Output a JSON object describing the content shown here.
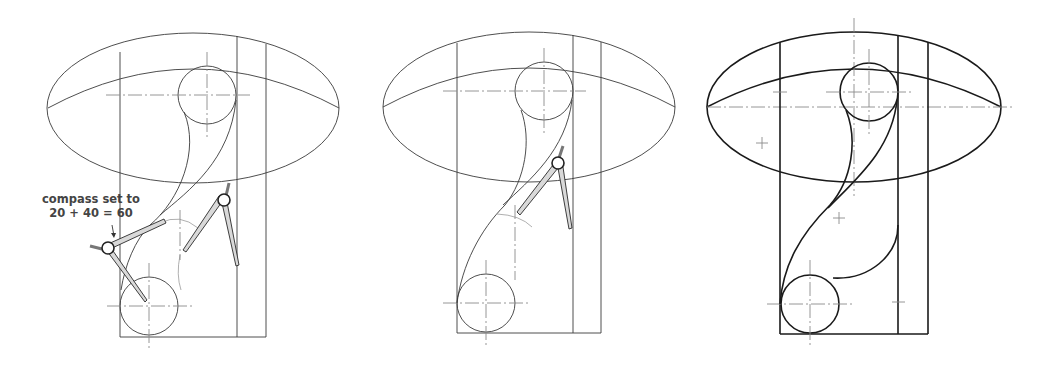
{
  "figure": {
    "panels": [
      {
        "id": "step-1",
        "description": "Compass set to radius sum; arcs swung from bottom circle and side line"
      },
      {
        "id": "step-2",
        "description": "Compass swinging tangent arc from located centre"
      },
      {
        "id": "step-3",
        "description": "Completed outline drawn in bold"
      }
    ],
    "annotation": {
      "line1": "compass set to",
      "line2": "20 + 40 = 60"
    },
    "colors": {
      "line": "#3a3a3a",
      "bold_line": "#1a1a1a",
      "centerline": "#8a8a8a",
      "compass_leg": "#d9d9d9"
    }
  }
}
